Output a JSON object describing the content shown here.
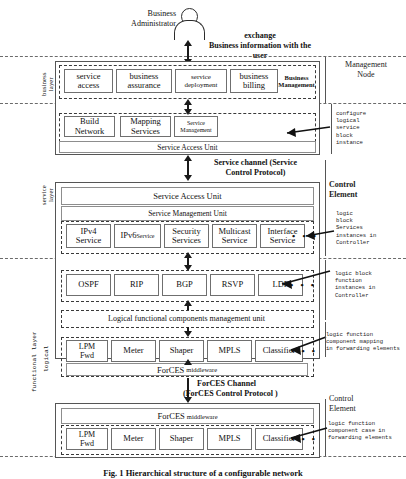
{
  "figure": {
    "actor": {
      "label": "Business\nAdministrator"
    },
    "top_note": "exchange\nBusiness information with the\nuser",
    "caption": "Fig. 1 Hierarchical structure of a configurable network"
  },
  "left_layers": [
    {
      "name": "business layer",
      "text": "business\nlayer"
    },
    {
      "name": "service layer",
      "text": "service\nlayer"
    },
    {
      "name": "functional layer",
      "text": "functional  layer"
    },
    {
      "name": "logical",
      "text": "logical"
    }
  ],
  "management_node": {
    "right_label": "Management\nNode",
    "business_row": {
      "boxes": [
        "service\naccess",
        "business\nassurance",
        "service\ndeployment",
        "business\nbilling"
      ],
      "plain_label": "Business\nManagement"
    },
    "service_row": {
      "boxes": [
        "Build\nNetwork",
        "Mapping\nServices",
        "Service\nManagement"
      ]
    },
    "service_access_unit": "Service Access Unit"
  },
  "service_channel": {
    "label": "Service channel (Service\nControl Protocol)"
  },
  "control_element_top": {
    "right_label": "Control\nElement",
    "service_access_unit": "Service Access Unit",
    "service_management_unit": "Service Management Unit",
    "service_blocks": [
      "IPv4\nService",
      "IPv6Service",
      "Security\nServices",
      "Multicast\nService",
      "Interface\nService"
    ],
    "ipv6_main": "IPv6",
    "ipv6_sub": "Service",
    "protocol_blocks": [
      "OSPF",
      "RIP",
      "BGP",
      "RSVP",
      "LDP"
    ],
    "lfc_management_unit": "Logical functional components management unit",
    "lfc_blocks": [
      "LPM\nFwd",
      "Meter",
      "Shaper",
      "MPLS",
      "Classifier"
    ],
    "forces_middleware": "ForCES middleware",
    "forces_middleware_main": "ForCES",
    "forces_middleware_sub": "middleware"
  },
  "forces_channel": {
    "label": "ForCES  Channel\n(ForCES Control Protocol )",
    "line1": "ForCES  Channel",
    "line2": "(ForCES Control Protocol )"
  },
  "forwarding_element": {
    "right_label": "Control\nElement",
    "forces_middleware_main": "ForCES",
    "forces_middleware_sub": "middleware",
    "lfc_blocks": [
      "LPM\nFwd",
      "Meter",
      "Shaper",
      "MPLS",
      "Classifier"
    ]
  },
  "annotations": [
    {
      "name": "configure-logical-service-block-instance",
      "text": "configure\nlogical\nservice\nblock\ninstance"
    },
    {
      "name": "logic-block-services-instances-in-controller",
      "text": "logic\nblock\nServices\ninstances in\nController"
    },
    {
      "name": "logic-block-function-instances-in-controller",
      "text": "logic block\nfunction\ninstances in\nController"
    },
    {
      "name": "logic-function-component-mapping-in-forwarding-elements",
      "text": "logic      function\ncomponent  mapping\nin  forwarding elements"
    },
    {
      "name": "logic-function-component-case-in-forwarding-elements",
      "text": "logic      function\ncomponent case in\nforwarding elements"
    }
  ],
  "dots": "• • •"
}
